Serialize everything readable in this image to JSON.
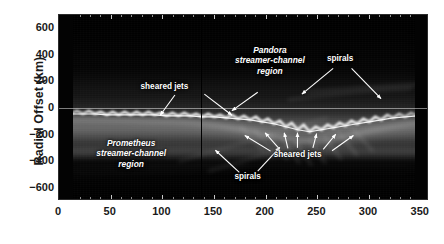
{
  "figure": {
    "type": "image-plot",
    "ylabel": "Radial Offset (km)",
    "xlabel": ""
  },
  "chart_data": {
    "type": "heatmap",
    "title": "",
    "subtitle": "",
    "xlabel": "",
    "ylabel": "Radial Offset (km)",
    "xlim": [
      0,
      358
    ],
    "ylim": [
      -700,
      700
    ],
    "xticks": [
      0,
      50,
      100,
      150,
      200,
      250,
      300,
      350
    ],
    "yticks": [
      600,
      400,
      200,
      0,
      -200,
      -400,
      -600
    ],
    "xtick_labels": [
      "0",
      "50",
      "100",
      "150",
      "200",
      "250",
      "300",
      "350"
    ],
    "ytick_labels": [
      "600",
      "400",
      "200",
      "0",
      "-200",
      "-400",
      "-600"
    ],
    "grid": false,
    "legend": false,
    "colormap": "grayscale",
    "markers": [
      {
        "name": "mosaic-seam",
        "kind": "vline",
        "x": 137
      },
      {
        "name": "zero-reference",
        "kind": "hline",
        "y": 0
      }
    ],
    "core_track": {
      "name": "F ring core",
      "x": [
        0,
        12,
        25,
        38,
        50,
        62,
        75,
        88,
        100,
        112,
        125,
        137,
        150,
        162,
        175,
        188,
        200,
        212,
        225,
        237,
        250,
        262,
        275,
        288,
        300,
        312,
        325,
        337,
        350,
        358
      ],
      "y": [
        -22,
        -18,
        -26,
        -14,
        -24,
        -16,
        -28,
        -18,
        -22,
        -30,
        -20,
        -26,
        -34,
        -30,
        -44,
        -38,
        -56,
        -48,
        -70,
        -40,
        -88,
        -58,
        -52,
        -34,
        -30,
        -22,
        -30,
        -18,
        -26,
        -20
      ]
    },
    "annotations": [
      {
        "id": "sheared-jets-upper",
        "label": "sheared jets",
        "style": "plain",
        "label_x": 0.285,
        "label_y": 0.385,
        "arrows": [
          {
            "x1": 0.315,
            "y1": 0.435,
            "x2": 0.275,
            "y2": 0.545
          },
          {
            "x1": 0.395,
            "y1": 0.43,
            "x2": 0.47,
            "y2": 0.545
          }
        ]
      },
      {
        "id": "pandora-region",
        "label": "Pandora\nstreamer-channel\nregion",
        "style": "italic",
        "label_x": 0.57,
        "label_y": 0.245,
        "arrows": [
          {
            "x1": 0.54,
            "y1": 0.42,
            "x2": 0.47,
            "y2": 0.52
          }
        ]
      },
      {
        "id": "spirals-upper-right",
        "label": "spirals",
        "style": "plain",
        "label_x": 0.76,
        "label_y": 0.235,
        "arrows": [
          {
            "x1": 0.745,
            "y1": 0.29,
            "x2": 0.66,
            "y2": 0.43
          },
          {
            "x1": 0.795,
            "y1": 0.29,
            "x2": 0.875,
            "y2": 0.455
          }
        ]
      },
      {
        "id": "prometheus-region",
        "label": "Prometheus\nstreamer-channel\nregion",
        "style": "italic",
        "label_x": 0.195,
        "label_y": 0.745,
        "arrows": []
      },
      {
        "id": "sheared-jets-lower",
        "label": "sheared jets",
        "style": "plain",
        "label_x": 0.645,
        "label_y": 0.755,
        "arrows": [
          {
            "x1": 0.575,
            "y1": 0.74,
            "x2": 0.505,
            "y2": 0.655
          },
          {
            "x1": 0.6,
            "y1": 0.73,
            "x2": 0.56,
            "y2": 0.64
          },
          {
            "x1": 0.622,
            "y1": 0.725,
            "x2": 0.612,
            "y2": 0.64
          },
          {
            "x1": 0.648,
            "y1": 0.722,
            "x2": 0.648,
            "y2": 0.64
          },
          {
            "x1": 0.69,
            "y1": 0.722,
            "x2": 0.7,
            "y2": 0.645
          },
          {
            "x1": 0.718,
            "y1": 0.73,
            "x2": 0.752,
            "y2": 0.648
          },
          {
            "x1": 0.742,
            "y1": 0.738,
            "x2": 0.8,
            "y2": 0.655
          }
        ]
      },
      {
        "id": "spirals-lower",
        "label": "spirals",
        "style": "plain",
        "label_x": 0.51,
        "label_y": 0.87,
        "arrows": [
          {
            "x1": 0.49,
            "y1": 0.855,
            "x2": 0.425,
            "y2": 0.735
          },
          {
            "x1": 0.54,
            "y1": 0.848,
            "x2": 0.6,
            "y2": 0.72
          }
        ]
      }
    ]
  }
}
